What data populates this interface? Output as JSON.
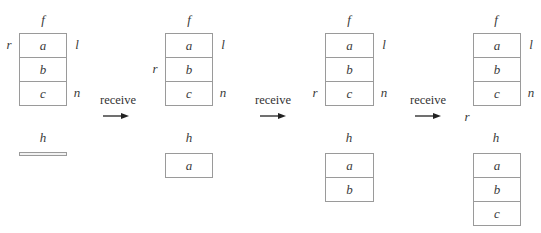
{
  "diagram": {
    "type": "queue-receive-sequence",
    "action_label": "receive",
    "panels": [
      {
        "f_label": "f",
        "h_label": "h",
        "f_items": [
          "a",
          "b",
          "c"
        ],
        "h_items": [],
        "pointers": {
          "r": "row0",
          "l": "row0",
          "n": "row2"
        }
      },
      {
        "f_label": "f",
        "h_label": "h",
        "f_items": [
          "a",
          "b",
          "c"
        ],
        "h_items": [
          "a"
        ],
        "pointers": {
          "r": "row1",
          "l": "row0",
          "n": "row2"
        }
      },
      {
        "f_label": "f",
        "h_label": "h",
        "f_items": [
          "a",
          "b",
          "c"
        ],
        "h_items": [
          "a",
          "b"
        ],
        "pointers": {
          "r": "row2",
          "l": "row0",
          "n": "row2"
        }
      },
      {
        "f_label": "f",
        "h_label": "h",
        "f_items": [
          "a",
          "b",
          "c"
        ],
        "h_items": [
          "a",
          "b",
          "c"
        ],
        "pointers": {
          "r": "past-end",
          "l": "row0",
          "n": "row2"
        }
      }
    ],
    "pointer_labels": {
      "r": "r",
      "l": "l",
      "n": "n"
    }
  }
}
